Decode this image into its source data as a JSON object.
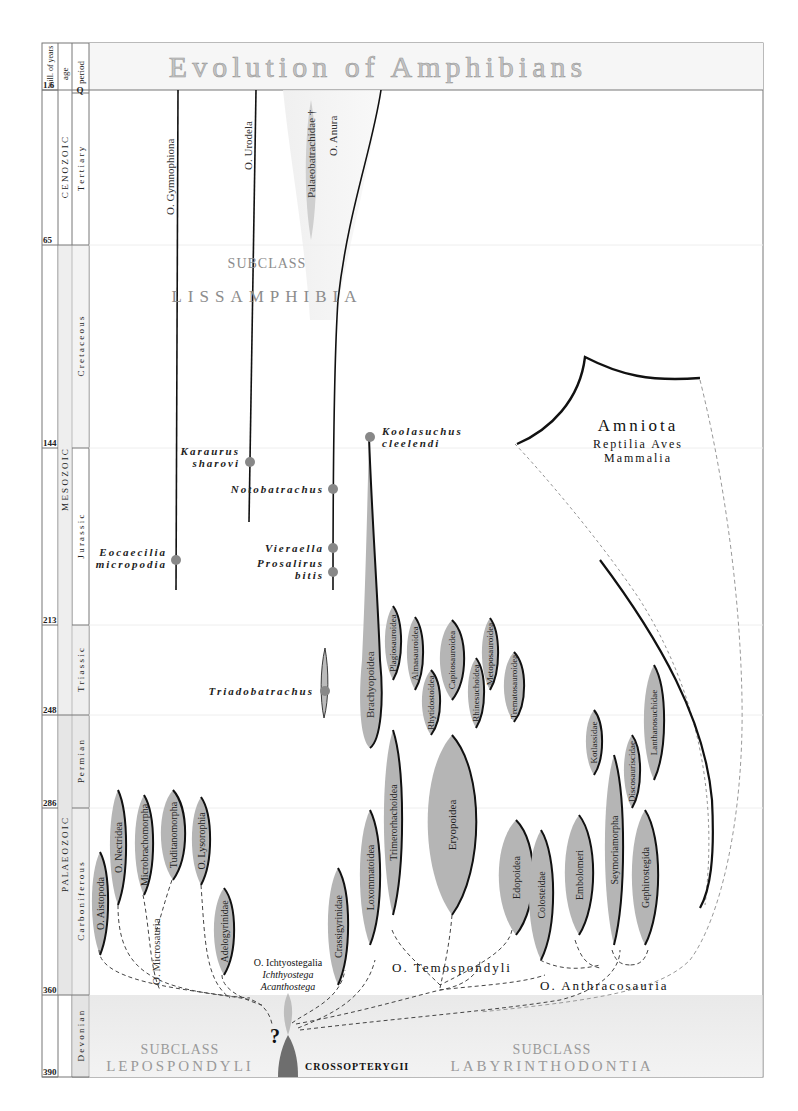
{
  "title": "Evolution of Amphibians",
  "timescale": {
    "headers": {
      "mya": "mill. of years",
      "age": "age",
      "period": "period"
    },
    "ticks": [
      {
        "label": "1.6",
        "y": 90
      },
      {
        "label": "65",
        "y": 245
      },
      {
        "label": "144",
        "y": 448
      },
      {
        "label": "213",
        "y": 625
      },
      {
        "label": "248",
        "y": 715
      },
      {
        "label": "286",
        "y": 808
      },
      {
        "label": "360",
        "y": 995
      },
      {
        "label": "390",
        "y": 1077
      }
    ],
    "eras": [
      {
        "label": "C E N O Z O I C",
        "y1": 90,
        "y2": 245
      },
      {
        "label": "M E S O Z O I C",
        "y1": 245,
        "y2": 715
      },
      {
        "label": "P A L A E O Z O I C",
        "y1": 715,
        "y2": 995
      }
    ],
    "periods": [
      {
        "label": "Q",
        "y1": 90,
        "y2": 93
      },
      {
        "label": "T e r t i a r y",
        "y1": 93,
        "y2": 245
      },
      {
        "label": "C r e t a c e o u s",
        "y1": 245,
        "y2": 448
      },
      {
        "label": "J u r a s s i c",
        "y1": 448,
        "y2": 625
      },
      {
        "label": "T r i a s s i c",
        "y1": 625,
        "y2": 715
      },
      {
        "label": "P e r m i a n",
        "y1": 715,
        "y2": 808
      },
      {
        "label": "C a r b o n i f e r o u s",
        "y1": 808,
        "y2": 995
      },
      {
        "label": "D e v o n i a n",
        "y1": 995,
        "y2": 1077
      }
    ]
  },
  "subclasses": {
    "lissamphibia": {
      "top": "SUBCLASS",
      "bottom": "LISSAMPHIBIA"
    },
    "lepospondyli": {
      "top": "SUBCLASS",
      "bottom": "LEPOSPONDYLI"
    },
    "labyrinthodontia": {
      "top": "SUBCLASS",
      "bottom": "LABYRINTHODONTIA"
    }
  },
  "orders": {
    "gymnophiona": "O. Gymnophiona",
    "urodela": "O. Urodela",
    "anura": "O. Anura",
    "palaeobatrachidae": "Palaeobatrachidae †",
    "temnospondyli": "O. Temospondyli",
    "anthracosauria": "O. Anthracosauria",
    "microsauria": "O. Microsauria",
    "ichthyostegalia": "O. Ichtyostegalia",
    "ichthyostega": "Ichthyostega",
    "acanthostega": "Acanthostega",
    "crossopterygii": "CROSSOPTERYGII",
    "question": "?"
  },
  "fossils": {
    "eocaecilia": [
      "Eocaecilia",
      "micropodia"
    ],
    "karaurus": [
      "Karaurus",
      "sharovi"
    ],
    "notobatrachus": [
      "Notobatrachus"
    ],
    "vieraella": [
      "Vieraella"
    ],
    "prosalirus": [
      "Prosalirus",
      "bitis"
    ],
    "koolasuchus": [
      "Koolasuchus",
      "cleelendi"
    ],
    "triadobatrachus": [
      "Triadobatrachus"
    ]
  },
  "amniota": {
    "title": "Amniota",
    "line1": "Reptilia Aves",
    "line2": "Mammalia"
  },
  "taxa": {
    "aistopoda": "O. Aistopoda",
    "nectridea": "O. Nectridea",
    "microbrachomorpha": "Microbrachomorpha",
    "tuditanomorpha": "Tuditanomorpha",
    "lysorophia": "O. Lysorophia",
    "adelogyrinidae": "Adelogyrinidae",
    "crassigyrinidae": "Crassigyrinidae",
    "loxommatoidea": "Loxommatoidea",
    "trimerorhachoidea": "Trimerorhachoidea",
    "eryopoidea": "Eryopoidea",
    "brachyopoidea": "Brachyopoidea",
    "plagiosauroidea": "Plagiosauroidea",
    "almasauroidea": "Almasauroidea",
    "rhytidostoidea": "Rhytidostoidea",
    "capitosauroidea": "Capitosauroidea",
    "rhinesuchoidea": "Rhinesuchoidea",
    "metoposauroidea": "Metoposauroidea",
    "trematosauroidea": "Trematosauroidea",
    "edopoidea": "Edopoidea",
    "colosteidae": "Colosteidae",
    "embolomeri": "Embolomeri",
    "seymouriamorpha": "Seymoriamorpha",
    "kotlassidae": "Kotlassidae",
    "discosauriscidae": "Discosauriscidae",
    "lanthanosuchidae": "Lanthanosuchidae",
    "gephyrostegida": "Gephirostegida"
  },
  "colors": {
    "blob": "#b5b5b5",
    "blob_dark": "#6e6e6e",
    "band_gray": "#eeeeee",
    "subclass_text": "#9a9a9a",
    "title_text": "#bfbfbf"
  }
}
